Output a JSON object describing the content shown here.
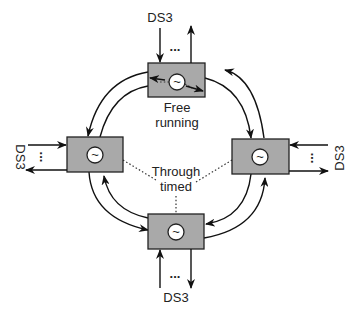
{
  "diagram": {
    "box_fill": "#a9a9a9",
    "line_color": "#111111",
    "nodes": [
      {
        "id": "top",
        "label": "Free running",
        "label_lines": [
          "Free",
          "running"
        ],
        "timing": "free-running",
        "oscillator": "~"
      },
      {
        "id": "left",
        "timing": "through-timed",
        "oscillator": "~"
      },
      {
        "id": "right",
        "timing": "through-timed",
        "oscillator": "~"
      },
      {
        "id": "bottom",
        "timing": "through-timed",
        "oscillator": "~"
      }
    ],
    "tributaries": {
      "top": {
        "label": "DS3",
        "ellipsis": "..."
      },
      "left": {
        "label": "DS3",
        "ellipsis": "..."
      },
      "right": {
        "label": "DS3",
        "ellipsis": "..."
      },
      "bottom": {
        "label": "DS3",
        "ellipsis": "..."
      }
    },
    "center_label": {
      "lines": [
        "Through",
        "timed"
      ]
    },
    "ring": {
      "type": "dual counter-rotating",
      "links": [
        "top-right",
        "right-bottom",
        "bottom-left",
        "left-top"
      ]
    }
  }
}
